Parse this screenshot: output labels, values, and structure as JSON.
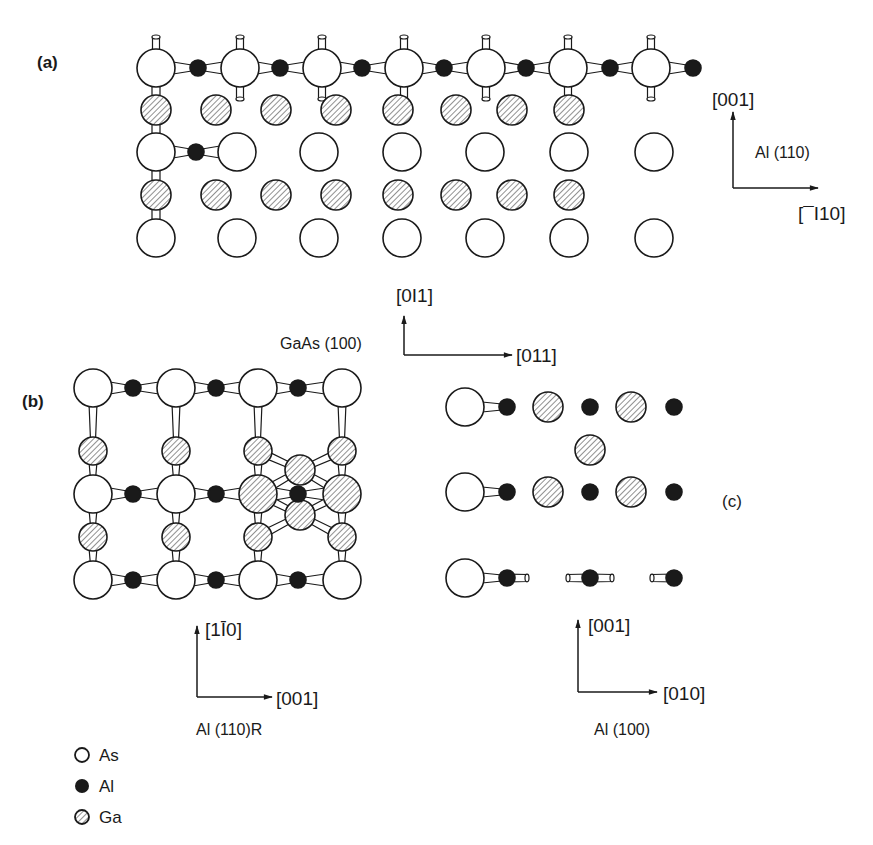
{
  "colors": {
    "ink": "#1a1a1a",
    "paper": "#ffffff",
    "hatch": "#555555"
  },
  "panel_a": {
    "label": "(a)",
    "axes": {
      "up": "[001]",
      "right": "[Ġ10]",
      "right_display": "[¯I10]",
      "plane": "Al (110)"
    },
    "as_radius": 19,
    "ga_radius": 15,
    "al_radius": 8,
    "as_top_row": {
      "y": 68,
      "x": [
        156,
        240,
        322,
        404,
        486,
        568,
        651
      ]
    },
    "al_top_row": {
      "y": 68,
      "x": [
        198,
        280,
        362,
        444,
        526,
        610,
        693
      ]
    },
    "ga_rows": [
      {
        "y": 110,
        "x": [
          156,
          216,
          276,
          336,
          398,
          456,
          512,
          569
        ]
      },
      {
        "y": 195,
        "x": [
          156,
          216,
          276,
          336,
          398,
          456,
          512,
          569
        ]
      }
    ],
    "as_rows": [
      {
        "y": 152,
        "x": [
          156,
          237,
          319,
          402,
          485,
          569,
          654
        ]
      },
      {
        "y": 238,
        "x": [
          156,
          237,
          319,
          402,
          485,
          569,
          654
        ]
      }
    ],
    "al_mid": {
      "x": 196,
      "y": 152
    }
  },
  "substrate_axes": {
    "up": "[0Ī1]",
    "up_display": "[0I1]",
    "right": "[011]",
    "plane": "GaAs (100)"
  },
  "panel_b": {
    "label": "(b)",
    "axes": {
      "up": "[1Ī0]",
      "right": "[001]",
      "plane": "Al (110)R"
    },
    "as_cols": [
      93,
      176,
      258,
      342
    ],
    "as_rows": [
      388,
      494,
      580
    ],
    "al_x": [
      133,
      216,
      298
    ],
    "ga_small_y": [
      451,
      537
    ]
  },
  "panel_c": {
    "label": "(c)",
    "axes": {
      "up": "[001]",
      "right": "[010]",
      "plane": "Al (100)"
    },
    "rows_y": [
      407,
      492,
      578
    ],
    "as_x": 465,
    "al_x": [
      507,
      590,
      674
    ],
    "ga_x": [
      548,
      631
    ],
    "ga_mid": {
      "x": 590,
      "y": 450
    }
  },
  "legend": {
    "items": [
      {
        "symbol": "open-circle",
        "label": "As"
      },
      {
        "symbol": "filled-circle",
        "label": "Al"
      },
      {
        "symbol": "hatched-circle",
        "label": "Ga"
      }
    ]
  }
}
